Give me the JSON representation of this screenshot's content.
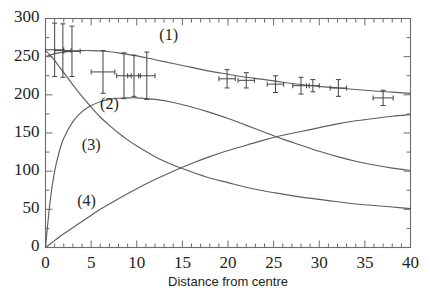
{
  "chart_data": {
    "type": "line",
    "title": "",
    "xlabel": "Distance from centre",
    "ylabel": "",
    "xlim": [
      0,
      40
    ],
    "ylim": [
      0,
      300
    ],
    "grid": false,
    "legend_position": "inline-annotations",
    "x_tick_labels": [
      "0",
      "5",
      "10",
      "15",
      "20",
      "25",
      "30",
      "35",
      "40"
    ],
    "x_tick_values": [
      0,
      5,
      10,
      15,
      20,
      25,
      30,
      35,
      40
    ],
    "x_minor_tick_interval": 1,
    "y_tick_labels": [
      "0",
      "50",
      "100",
      "150",
      "200",
      "250",
      "300"
    ],
    "y_tick_values": [
      0,
      50,
      100,
      150,
      200,
      250,
      300
    ],
    "annotations": [
      {
        "text": "(1)",
        "x": 13.5,
        "y": 272
      },
      {
        "text": "(2)",
        "x": 7.0,
        "y": 182
      },
      {
        "text": "(3)",
        "x": 5.0,
        "y": 128
      },
      {
        "text": "(4)",
        "x": 4.5,
        "y": 55
      }
    ],
    "series": [
      {
        "name": "(1)",
        "kind": "curve",
        "x": [
          0,
          1,
          2,
          3,
          4,
          5,
          6,
          7,
          8,
          9,
          10,
          12,
          14,
          16,
          18,
          20,
          22,
          24,
          26,
          28,
          30,
          32,
          34,
          36,
          38,
          40
        ],
        "values": [
          250,
          254,
          256,
          257.5,
          258,
          258,
          257.5,
          256.5,
          255,
          253,
          251,
          246,
          241,
          236,
          231,
          227,
          223,
          220,
          216.5,
          213.5,
          211,
          209,
          207,
          205,
          203.5,
          202
        ]
      },
      {
        "name": "(2)",
        "kind": "curve",
        "x": [
          0,
          0.5,
          1,
          1.5,
          2,
          3,
          4,
          5,
          6,
          7,
          8,
          9,
          10,
          12,
          14,
          16,
          18,
          20,
          22,
          24,
          26,
          28,
          30,
          32,
          34,
          36,
          38,
          40
        ],
        "values": [
          0,
          60,
          100,
          125,
          143,
          165,
          178,
          186,
          191,
          194,
          195.5,
          196,
          196,
          194,
          190,
          184,
          177,
          169,
          160,
          151,
          142,
          134,
          126,
          119,
          113,
          108,
          104,
          101
        ]
      },
      {
        "name": "(3)",
        "kind": "curve",
        "x": [
          0,
          0.5,
          1,
          1.5,
          2,
          3,
          4,
          5,
          6,
          7,
          8,
          9,
          10,
          12,
          14,
          16,
          18,
          20,
          22,
          24,
          26,
          28,
          30,
          32,
          34,
          36,
          38,
          40
        ],
        "values": [
          258,
          252,
          245,
          237,
          229,
          213,
          198,
          184,
          171,
          160,
          150,
          141,
          133,
          119,
          108,
          99,
          91,
          85,
          79,
          74,
          70,
          66,
          63,
          60,
          57,
          55,
          53,
          51
        ]
      },
      {
        "name": "(4)",
        "kind": "curve",
        "x": [
          0,
          1,
          2,
          3,
          4,
          5,
          6,
          8,
          10,
          12,
          14,
          16,
          18,
          20,
          22,
          24,
          26,
          28,
          30,
          32,
          34,
          36,
          38,
          40
        ],
        "values": [
          0,
          9,
          18,
          26,
          34,
          42,
          50,
          64,
          77,
          89,
          100,
          110,
          119,
          127,
          134,
          141,
          147,
          152,
          157,
          162,
          166,
          169,
          172,
          174
        ]
      }
    ],
    "data_points": [
      {
        "x": 1.0,
        "y": 259,
        "xerr": 1.0,
        "yerr": 35
      },
      {
        "x": 1.9,
        "y": 258,
        "xerr": 0.9,
        "yerr": 35
      },
      {
        "x": 2.9,
        "y": 257,
        "xerr": 0.9,
        "yerr": 33
      },
      {
        "x": 6.3,
        "y": 230,
        "xerr": 1.3,
        "yerr": 28
      },
      {
        "x": 8.6,
        "y": 225,
        "xerr": 0.8,
        "yerr": 30
      },
      {
        "x": 9.7,
        "y": 225,
        "xerr": 0.7,
        "yerr": 27
      },
      {
        "x": 11.1,
        "y": 225,
        "xerr": 0.9,
        "yerr": 31
      },
      {
        "x": 19.9,
        "y": 221,
        "xerr": 0.9,
        "yerr": 12
      },
      {
        "x": 22.0,
        "y": 219,
        "xerr": 0.9,
        "yerr": 10
      },
      {
        "x": 25.2,
        "y": 214,
        "xerr": 0.9,
        "yerr": 11
      },
      {
        "x": 28.0,
        "y": 212,
        "xerr": 0.9,
        "yerr": 11
      },
      {
        "x": 29.3,
        "y": 212,
        "xerr": 0.7,
        "yerr": 8
      },
      {
        "x": 32.1,
        "y": 209,
        "xerr": 0.9,
        "yerr": 11
      },
      {
        "x": 37.0,
        "y": 196,
        "xerr": 1.1,
        "yerr": 10
      }
    ]
  },
  "axis": {
    "x_title": "Distance from centre"
  }
}
